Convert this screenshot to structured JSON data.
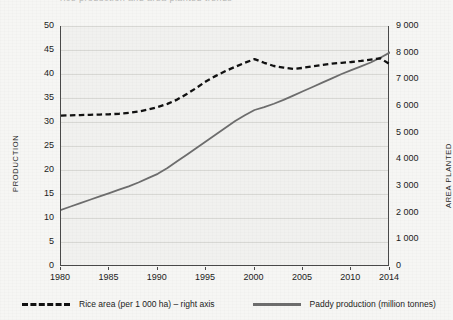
{
  "artifact": {
    "top_cut_text": "rice production and area planted trends"
  },
  "axes": {
    "left_title": "PRODUCTION",
    "right_title": "AREA PLANTED",
    "left_ticks": [
      "0",
      "5",
      "10",
      "15",
      "20",
      "25",
      "30",
      "35",
      "40",
      "45",
      "50"
    ],
    "right_ticks": [
      "0",
      "1 000",
      "2 000",
      "3 000",
      "4 000",
      "5 000",
      "6 000",
      "7 000",
      "8 000",
      "9 000"
    ],
    "x_ticks": [
      "1980",
      "1985",
      "1990",
      "1995",
      "2000",
      "2005",
      "2010",
      "2014"
    ]
  },
  "legend": {
    "area_label": "Rice area (per 1 000 ha) – right axis",
    "production_label": "Paddy production (million tonnes)"
  },
  "colors": {
    "area_line": "#111111",
    "production_line": "#6d6d6d",
    "plot_background": "#f1f1ef",
    "gridline": "#d8d8d4",
    "axis": "#4a4a4a"
  },
  "chart_data": {
    "type": "line",
    "title": "",
    "subtitle": "",
    "xlabel": "",
    "ylabel": "PRODUCTION",
    "y2label": "AREA PLANTED",
    "xlim": [
      1980,
      2014
    ],
    "ylim": [
      0,
      50
    ],
    "y2lim": [
      0,
      9000
    ],
    "y_tick_step": 5,
    "y2_tick_step": 1000,
    "grid": true,
    "legend_position": "bottom",
    "x": [
      1980,
      1981,
      1982,
      1983,
      1984,
      1985,
      1986,
      1987,
      1988,
      1989,
      1990,
      1991,
      1992,
      1993,
      1994,
      1995,
      1996,
      1997,
      1998,
      1999,
      2000,
      2001,
      2002,
      2003,
      2004,
      2005,
      2006,
      2007,
      2008,
      2009,
      2010,
      2011,
      2012,
      2013,
      2014
    ],
    "series": [
      {
        "name": "Rice area (per 1 000 ha) – right axis",
        "axis": "right",
        "style": "dashed",
        "color": "#111111",
        "unit": "1 000 ha",
        "values": [
          5640,
          5650,
          5660,
          5670,
          5680,
          5690,
          5710,
          5740,
          5790,
          5870,
          5960,
          6080,
          6240,
          6450,
          6680,
          6930,
          7130,
          7310,
          7470,
          7620,
          7760,
          7620,
          7500,
          7440,
          7390,
          7430,
          7490,
          7540,
          7590,
          7620,
          7650,
          7690,
          7740,
          7790,
          7560
        ]
      },
      {
        "name": "Paddy production (million tonnes)",
        "axis": "left",
        "style": "solid",
        "color": "#6d6d6d",
        "unit": "million tonnes",
        "values": [
          11.7,
          12.4,
          13.1,
          13.8,
          14.5,
          15.2,
          15.9,
          16.6,
          17.4,
          18.3,
          19.2,
          20.4,
          21.8,
          23.2,
          24.6,
          26.0,
          27.4,
          28.8,
          30.2,
          31.4,
          32.5,
          33.1,
          33.8,
          34.6,
          35.5,
          36.4,
          37.3,
          38.2,
          39.1,
          40.0,
          40.8,
          41.6,
          42.4,
          43.4,
          44.5
        ]
      }
    ]
  }
}
